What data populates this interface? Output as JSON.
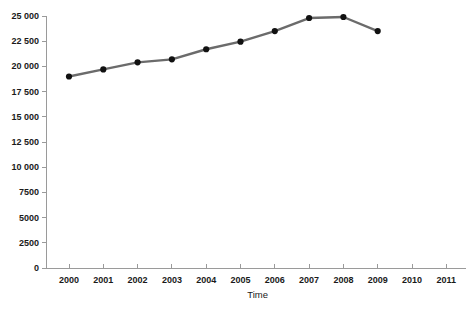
{
  "chart_data": {
    "type": "line",
    "title": "",
    "subtitle": "",
    "xlabel": "Time",
    "ylabel": "",
    "x": [
      2000,
      2001,
      2002,
      2003,
      2004,
      2005,
      2006,
      2007,
      2008,
      2009
    ],
    "categories": [
      "2000",
      "2001",
      "2002",
      "2003",
      "2004",
      "2005",
      "2006",
      "2007",
      "2008",
      "2009"
    ],
    "values": [
      19000,
      19700,
      20400,
      20700,
      21700,
      22450,
      23500,
      24800,
      24900,
      23500
    ],
    "series": [
      {
        "name": "",
        "values": [
          19000,
          19700,
          20400,
          20700,
          21700,
          22450,
          23500,
          24800,
          24900,
          23500
        ]
      }
    ],
    "xlim": [
      2000,
      2011
    ],
    "ylim": [
      0,
      25000
    ],
    "x_tick_labels": [
      "2000",
      "2001",
      "2002",
      "2003",
      "2004",
      "2005",
      "2006",
      "2007",
      "2008",
      "2009",
      "2010",
      "2011"
    ],
    "x_tick_values": [
      2000,
      2001,
      2002,
      2003,
      2004,
      2005,
      2006,
      2007,
      2008,
      2009,
      2010,
      2011
    ],
    "y_tick_labels": [
      "25 000",
      "22 500",
      "20 000",
      "17 500",
      "15 000",
      "12 500",
      "10 000",
      "7500",
      "5000",
      "2500",
      "0"
    ],
    "y_tick_values": [
      25000,
      22500,
      20000,
      17500,
      15000,
      12500,
      10000,
      7500,
      5000,
      2500,
      0
    ],
    "grid": false,
    "legend": null,
    "legend_position": "none",
    "annotations": [],
    "colors": {
      "line": "#6b6b6b",
      "marker": "#111111",
      "axis": "#9a9a9a",
      "text": "#1a1a1a",
      "background": "#ffffff"
    },
    "marker": "circle",
    "line_width": 2.4
  }
}
